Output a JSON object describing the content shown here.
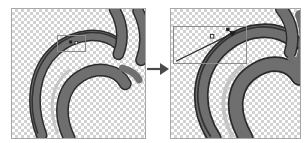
{
  "figure": {
    "type": "before-after-zoom-comparison",
    "background_color": "#ffffff",
    "width": 306,
    "height": 143,
    "caption": ""
  },
  "checkerboard": {
    "name": "transparency-checkerboard",
    "light_color": "#ffffff",
    "dark_color": "#d2d2d2",
    "cell_size_px": 3
  },
  "artwork": {
    "name": "swirl-spiral-vector-graphic",
    "stroke_fill_color": "#6f6f6f",
    "outline_color": "#2b2b2b",
    "highlight_color": "#bdbdbd",
    "description": "Spiral swirl graphic drawn as thick gray ribbons with a thin dark outline, shown over a transparency checkerboard."
  },
  "panels": [
    {
      "id": "before",
      "name": "panel-before",
      "label": "",
      "role": "original view",
      "selection_box": {
        "name": "selection-box-before",
        "label": "",
        "stroke_color": "#8c8c8c",
        "x": 45,
        "y": 26,
        "width": 29,
        "height": 17
      },
      "node_marker": {
        "name": "node-marker-before",
        "label": "",
        "color": "#1e1e1e"
      }
    },
    {
      "id": "after",
      "name": "panel-after",
      "label": "",
      "role": "zoomed detail view",
      "selection_box": {
        "name": "selection-box-after",
        "label": "",
        "stroke_color": "#8c8c8c",
        "x": 2,
        "y": 17,
        "width": 74,
        "height": 38
      },
      "leader_line": {
        "name": "leader-line",
        "label": "",
        "stroke_color": "#2b2b2b"
      },
      "node_marker": {
        "name": "node-marker-after",
        "label": "",
        "color": "#1e1e1e"
      }
    }
  ],
  "arrow": {
    "name": "transform-arrow",
    "direction": "right",
    "label": "",
    "color": "#4a4a4a"
  }
}
